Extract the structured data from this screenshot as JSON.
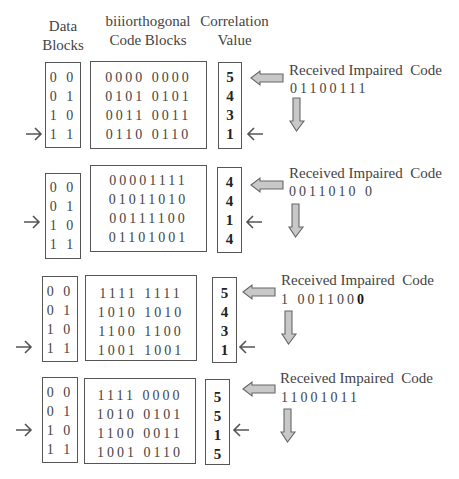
{
  "headers": {
    "data_blocks": [
      "Data",
      "Blocks"
    ],
    "code_blocks": [
      "biiiorthogonal",
      "Code Blocks"
    ],
    "correlation": [
      "Correlation",
      "Value"
    ]
  },
  "received_label": "Received Impaired  Code",
  "stages": [
    {
      "data_blocks": [
        "0 0",
        "0 1",
        "1 0",
        "1 1"
      ],
      "code_blocks": [
        "0000 0000",
        "0101 0101",
        "0011 0011",
        "0110 0110"
      ],
      "correlation": [
        "5",
        "4",
        "3",
        "1"
      ],
      "received_code": "01100111",
      "selected_index": 3
    },
    {
      "data_blocks": [
        "0 0",
        "0 1",
        "1 0",
        "1 1"
      ],
      "code_blocks": [
        "00001111",
        "01011010",
        "00111100",
        "01101001"
      ],
      "correlation": [
        "4",
        "4",
        "1",
        "4"
      ],
      "received_code": "0011010 0",
      "selected_index": 2
    },
    {
      "data_blocks": [
        "0 0",
        "0 1",
        "1 0",
        "1 1"
      ],
      "code_blocks": [
        "1111 1111",
        "1010 1010",
        "1100 1100",
        "1001 1001"
      ],
      "correlation": [
        "5",
        "4",
        "3",
        "1"
      ],
      "received_code": "1 0011000",
      "received_code_bold_last": true,
      "selected_index": 3
    },
    {
      "data_blocks": [
        "0 0",
        "0 1",
        "1 0",
        "1 1"
      ],
      "code_blocks": [
        "1111 0000",
        "1010 0101",
        "1100 0011",
        "1001 0110"
      ],
      "correlation": [
        "5",
        "5",
        "1",
        "5"
      ],
      "received_code": "11001011",
      "selected_index": 2
    }
  ]
}
